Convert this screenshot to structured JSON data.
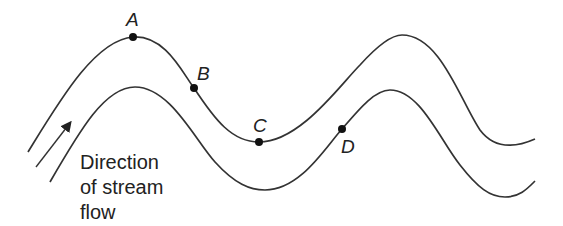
{
  "diagram": {
    "type": "meandering stream map",
    "points": [
      {
        "id": "A",
        "label": "A"
      },
      {
        "id": "B",
        "label": "B"
      },
      {
        "id": "C",
        "label": "C"
      },
      {
        "id": "D",
        "label": "D"
      }
    ],
    "caption": {
      "line1": "Direction",
      "line2": "of stream",
      "line3": "flow"
    },
    "colors": {
      "line": "#333333",
      "dot": "#111111",
      "background": "#ffffff"
    }
  }
}
